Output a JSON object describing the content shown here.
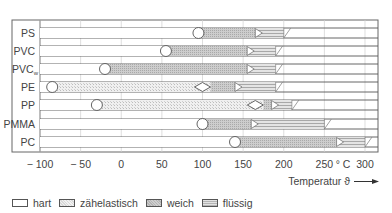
{
  "chart_data": {
    "type": "bar",
    "subtype": "horizontal-range-stacked",
    "title": "",
    "xlabel": "Temperatur ϑ",
    "x_unit": "°C",
    "xlim": [
      -100,
      300
    ],
    "x_ticks": [
      -100,
      -50,
      0,
      50,
      100,
      150,
      200,
      250,
      300
    ],
    "x_tick_labels": [
      "− 100",
      "− 50",
      "0",
      "50",
      "100",
      "150",
      "200",
      "250",
      "300"
    ],
    "unit_label": "° C",
    "grid": true,
    "legend_position": "bottom",
    "categories": [
      "PS",
      "PVC",
      "PVCw",
      "PE",
      "PP",
      "PMMA",
      "PC"
    ],
    "category_labels": [
      "PS",
      "PVC",
      "PVC",
      "PE",
      "PP",
      "PMMA",
      "PC"
    ],
    "category_subscripts": [
      "",
      "",
      "w",
      "",
      "",
      "",
      ""
    ],
    "states": [
      "hart",
      "zähelastisch",
      "weich",
      "flüssig"
    ],
    "rows": [
      {
        "name": "PS",
        "segments": [
          {
            "state": "hart",
            "from": -100,
            "to": 95
          },
          {
            "state": "weich",
            "from": 95,
            "to": 165
          },
          {
            "state": "flüssig",
            "from": 165,
            "to": 200
          }
        ],
        "markers": [
          {
            "type": "circle",
            "x": 95
          },
          {
            "type": "triangle",
            "x": 165
          }
        ]
      },
      {
        "name": "PVC",
        "segments": [
          {
            "state": "hart",
            "from": -100,
            "to": 55
          },
          {
            "state": "weich",
            "from": 55,
            "to": 155
          },
          {
            "state": "flüssig",
            "from": 155,
            "to": 190
          }
        ],
        "markers": [
          {
            "type": "circle",
            "x": 55
          },
          {
            "type": "triangle",
            "x": 155
          }
        ]
      },
      {
        "name": "PVCw",
        "segments": [
          {
            "state": "hart",
            "from": -100,
            "to": -20
          },
          {
            "state": "weich",
            "from": -20,
            "to": 155
          },
          {
            "state": "flüssig",
            "from": 155,
            "to": 190
          }
        ],
        "markers": [
          {
            "type": "circle",
            "x": -20
          },
          {
            "type": "triangle",
            "x": 155
          }
        ]
      },
      {
        "name": "PE",
        "segments": [
          {
            "state": "hart",
            "from": -100,
            "to": -85
          },
          {
            "state": "zähelastisch",
            "from": -85,
            "to": 110
          },
          {
            "state": "weich",
            "from": 110,
            "to": 140
          },
          {
            "state": "flüssig",
            "from": 140,
            "to": 190
          }
        ],
        "markers": [
          {
            "type": "circle",
            "x": -85
          },
          {
            "type": "diamond",
            "x": 100
          },
          {
            "type": "triangle",
            "x": 140
          }
        ]
      },
      {
        "name": "PP",
        "segments": [
          {
            "state": "hart",
            "from": -100,
            "to": -30
          },
          {
            "state": "zähelastisch",
            "from": -30,
            "to": 175
          },
          {
            "state": "weich",
            "from": 175,
            "to": 185
          },
          {
            "state": "flüssig",
            "from": 185,
            "to": 210
          }
        ],
        "markers": [
          {
            "type": "circle",
            "x": -30
          },
          {
            "type": "diamond",
            "x": 165
          },
          {
            "type": "triangle",
            "x": 185
          }
        ]
      },
      {
        "name": "PMMA",
        "segments": [
          {
            "state": "hart",
            "from": -100,
            "to": 100
          },
          {
            "state": "weich",
            "from": 100,
            "to": 160
          },
          {
            "state": "flüssig",
            "from": 160,
            "to": 250
          }
        ],
        "markers": [
          {
            "type": "circle",
            "x": 100
          },
          {
            "type": "triangle",
            "x": 160
          }
        ]
      },
      {
        "name": "PC",
        "segments": [
          {
            "state": "hart",
            "from": -100,
            "to": 140
          },
          {
            "state": "weich",
            "from": 140,
            "to": 265
          },
          {
            "state": "flüssig",
            "from": 265,
            "to": 300
          }
        ],
        "markers": [
          {
            "type": "circle",
            "x": 140
          },
          {
            "type": "triangle",
            "x": 265
          }
        ]
      }
    ]
  },
  "legend": {
    "items": [
      {
        "key": "hart",
        "label": "hart"
      },
      {
        "key": "zah",
        "label": "zähelastisch"
      },
      {
        "key": "weich",
        "label": "weich"
      },
      {
        "key": "fl",
        "label": "flüssig"
      }
    ]
  },
  "axis": {
    "temperature_label": "Temperatur ϑ",
    "unit_label": "° C"
  },
  "colors": {
    "frame": "#555555",
    "hart": "#ffffff",
    "zahelastisch": "#e6e6e6",
    "weich": "#c2c2c2",
    "flussig": "#cdcdcd"
  }
}
